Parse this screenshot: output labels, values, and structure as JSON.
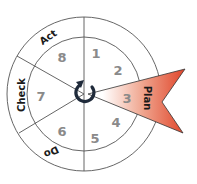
{
  "diagram": {
    "type": "cycle-wheel",
    "center_icon": "cycle-arrow-icon",
    "phases": [
      {
        "label": "Plan",
        "highlighted": true
      },
      {
        "label": "Do",
        "highlighted": false
      },
      {
        "label": "Check",
        "highlighted": false
      },
      {
        "label": "Act",
        "highlighted": false
      }
    ],
    "steps": [
      "1",
      "2",
      "3",
      "4",
      "5",
      "6",
      "7",
      "8"
    ],
    "colors": {
      "highlight_start": "#ffffff",
      "highlight_end": "#e0452a",
      "line": "#555555",
      "step_text": "#8a8a8a",
      "phase_text": "#1a1a1a",
      "icon": "#1f2a3a"
    }
  }
}
